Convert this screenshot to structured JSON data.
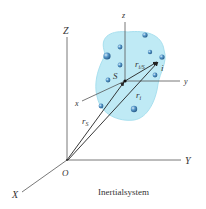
{
  "diagram": {
    "title": "Inertialsystem",
    "colors": {
      "blob": "#bfeaf5",
      "blob_edge": "#a8e0ef",
      "particle": "#4a8fc2",
      "particle_dark": "#2a6a9e",
      "axis": "#555555",
      "vector": "#222222"
    },
    "global_axes": {
      "X": "X",
      "Y": "Y",
      "Z": "Z",
      "origin": "O"
    },
    "local_axes": {
      "x": "x",
      "y": "y",
      "z": "z",
      "origin": "S"
    },
    "vectors": {
      "r_S": {
        "main": "r",
        "sub": "S"
      },
      "r_i": {
        "main": "r",
        "sub": "i"
      },
      "r_iS": {
        "main": "r",
        "sub": "i/S"
      }
    },
    "point_i": "i"
  }
}
